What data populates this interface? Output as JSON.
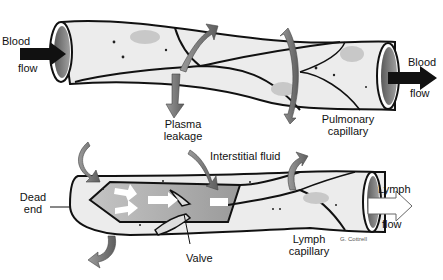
{
  "figure": {
    "top_panel": {
      "structure": "Pulmonary capillary",
      "labels": {
        "blood_in_1": "Blood",
        "blood_in_2": "flow",
        "blood_out_1": "Blood",
        "blood_out_2": "flow",
        "plasma_1": "Plasma",
        "plasma_2": "leakage",
        "pulmonary_1": "Pulmonary",
        "pulmonary_2": "capillary"
      }
    },
    "bottom_panel": {
      "structure": "Lymph capillary",
      "labels": {
        "interstitial": "Interstitial fluid",
        "dead_1": "Dead",
        "dead_2": "end",
        "valve": "Valve",
        "lymph_cap_1": "Lymph",
        "lymph_cap_2": "capillary",
        "lymph_flow_1": "Lymph",
        "lymph_flow_2": "flow"
      }
    },
    "signature": "G. Cottrell",
    "colors": {
      "tube_fill": "#e8e8e8",
      "outline": "#111111",
      "arrow_gray": "#7a7a7a",
      "lumen": "#8a8a8a",
      "inner_gray": "#a8a8a8",
      "cell_spot": "#c8c8c8"
    }
  }
}
